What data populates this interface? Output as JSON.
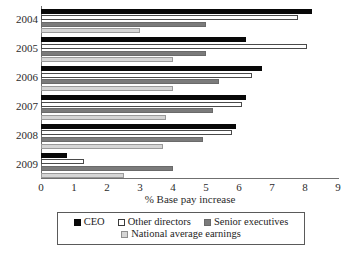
{
  "chart_data": {
    "type": "bar",
    "orientation": "horizontal",
    "title": "",
    "xlabel": "% Base pay increase",
    "ylabel": "",
    "xlim": [
      0,
      9
    ],
    "xticks": [
      0,
      1,
      2,
      3,
      4,
      5,
      6,
      7,
      8,
      9
    ],
    "grid": false,
    "legend_position": "bottom",
    "categories": [
      "2004",
      "2005",
      "2006",
      "2007",
      "2008",
      "2009"
    ],
    "series": [
      {
        "name": "CEO",
        "color": "#080808",
        "values": [
          8.2,
          6.2,
          6.7,
          6.2,
          5.9,
          0.8
        ]
      },
      {
        "name": "Other directors",
        "color": "#ffffff",
        "values": [
          7.8,
          8.05,
          6.4,
          6.1,
          5.8,
          1.3
        ]
      },
      {
        "name": "Senior executives",
        "color": "#7b7b7b",
        "values": [
          5.0,
          5.0,
          5.4,
          5.2,
          4.9,
          4.0
        ]
      },
      {
        "name": "National average earnings",
        "color": "#d5d5d5",
        "values": [
          3.0,
          4.0,
          4.0,
          3.8,
          3.7,
          2.5
        ]
      }
    ]
  },
  "axis": {
    "x_label": "% Base pay increase",
    "x_tick_labels": [
      "0",
      "1",
      "2",
      "3",
      "4",
      "5",
      "6",
      "7",
      "8",
      "9"
    ],
    "y_tick_labels": [
      "2004",
      "2005",
      "2006",
      "2007",
      "2008",
      "2009"
    ]
  },
  "legend": {
    "row1": [
      {
        "label": "CEO",
        "swatch": "filled-black-square-icon"
      },
      {
        "label": "Other directors",
        "swatch": "empty-white-square-icon"
      },
      {
        "label": "Senior executives",
        "swatch": "filled-darkgray-square-icon"
      }
    ],
    "row2": [
      {
        "label": "National average earnings",
        "swatch": "filled-lightgray-square-icon"
      }
    ]
  }
}
